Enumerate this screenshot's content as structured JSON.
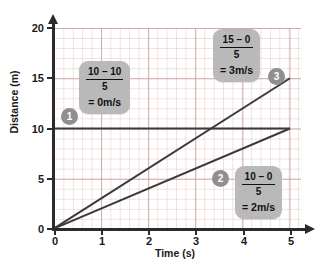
{
  "chart_data": {
    "type": "line",
    "title": "",
    "xlabel": "Time (s)",
    "ylabel": "Distance (m)",
    "xlim": [
      0,
      5
    ],
    "ylim": [
      0,
      20
    ],
    "xticks": [
      0,
      1,
      2,
      3,
      4,
      5
    ],
    "yticks": [
      0,
      5,
      10,
      15,
      20
    ],
    "grid": true,
    "legend": "none",
    "series": [
      {
        "name": "1",
        "label": "0 m/s",
        "slope": 0,
        "points": [
          [
            0,
            10
          ],
          [
            5,
            10
          ]
        ],
        "color": "#3a3a3a"
      },
      {
        "name": "2",
        "label": "2 m/s",
        "slope": 2,
        "points": [
          [
            0,
            0
          ],
          [
            5,
            10
          ]
        ],
        "color": "#3a3a3a"
      },
      {
        "name": "3",
        "label": "3 m/s",
        "slope": 3,
        "points": [
          [
            0,
            0
          ],
          [
            5,
            15
          ]
        ],
        "color": "#3a3a3a"
      }
    ],
    "annotations": [
      {
        "id": "1",
        "numerator": "10 – 10",
        "denominator": "5",
        "result": "= 0m/s"
      },
      {
        "id": "2",
        "numerator": "10 – 0",
        "denominator": "5",
        "result": "= 2m/s"
      },
      {
        "id": "3",
        "numerator": "15 – 0",
        "denominator": "5",
        "result": "= 3m/s"
      }
    ]
  },
  "axes": {
    "y_title": "Distance (m)",
    "x_title": "Time (s)",
    "y_tick_labels": [
      "20",
      "15",
      "10",
      "5",
      "0"
    ],
    "x_tick_labels": [
      "0",
      "1",
      "2",
      "3",
      "4",
      "5"
    ]
  },
  "colors": {
    "callout_background": "#b9b9b9",
    "marker_background": "#8f8f8f",
    "line": "#3a3a3a",
    "axis": "#2b2b2b",
    "grid_minor": "#e2baba",
    "grid_major": "#c69696"
  }
}
